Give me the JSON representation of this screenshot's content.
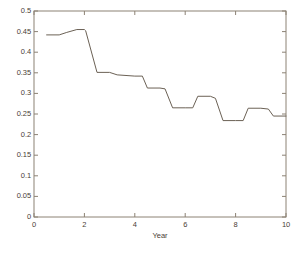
{
  "chart_data": {
    "type": "line",
    "title": "",
    "xlabel": "Year",
    "ylabel": "",
    "xlim": [
      0,
      10
    ],
    "ylim": [
      0,
      0.5
    ],
    "grid": false,
    "legend": null,
    "xticks": [
      "0",
      "2",
      "4",
      "6",
      "8",
      "10"
    ],
    "xtick_values": [
      0,
      2,
      4,
      6,
      8,
      10
    ],
    "yticks": [
      "0",
      "0.05",
      "0.1",
      "0.15",
      "0.2",
      "0.25",
      "0.3",
      "0.35",
      "0.4",
      "0.45",
      "0.5"
    ],
    "ytick_values": [
      0,
      0.05,
      0.1,
      0.15,
      0.2,
      0.25,
      0.3,
      0.35,
      0.4,
      0.45,
      0.5
    ],
    "series": [
      {
        "name": "series-1",
        "color": "#6b6155",
        "x": [
          0.5,
          1.0,
          1.3,
          1.7,
          2.0,
          2.05,
          2.5,
          3.0,
          3.3,
          4.0,
          4.3,
          4.5,
          5.0,
          5.2,
          5.5,
          6.0,
          6.3,
          6.5,
          7.0,
          7.2,
          7.5,
          8.0,
          8.3,
          8.5,
          9.0,
          9.3,
          9.5,
          10.0
        ],
        "y": [
          0.442,
          0.442,
          0.448,
          0.455,
          0.455,
          0.452,
          0.351,
          0.351,
          0.345,
          0.342,
          0.342,
          0.313,
          0.313,
          0.311,
          0.265,
          0.265,
          0.265,
          0.293,
          0.293,
          0.288,
          0.234,
          0.234,
          0.234,
          0.264,
          0.264,
          0.262,
          0.245,
          0.245
        ]
      }
    ]
  },
  "axes": {
    "frame_color": "#8c8274",
    "tick_color": "#8c8274",
    "background": "#ffffff"
  }
}
